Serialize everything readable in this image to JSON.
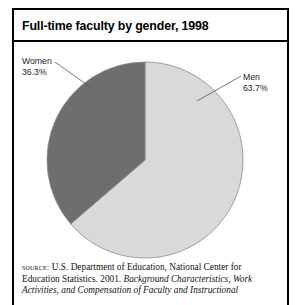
{
  "figure": {
    "title": "Full-time faculty by gender, 1998",
    "frame_color": "#000000",
    "background": "#ffffff"
  },
  "labels": {
    "women_name": "Women",
    "women_value": "36.3%",
    "men_name": "Men",
    "men_value": "63.7%"
  },
  "source": {
    "prefix": "source:",
    "line1_rest": " U.S. Department of Education, National Center for",
    "line2_roman": "Education Statistics. 2001. ",
    "line2_italic": "Background Characteristics, Work",
    "line3_italic": "Activities, and Compensation of Faculty and Instructional"
  },
  "chart_data": {
    "type": "pie",
    "title": "Full-time faculty by gender, 1998",
    "categories": [
      "Men",
      "Women"
    ],
    "values": [
      63.7,
      36.3
    ],
    "units": "percent",
    "labels": [
      "Men 63.7%",
      "Women 36.3%"
    ],
    "colors": [
      "#d9d9d9",
      "#6e6e6e"
    ],
    "slice_colors": {
      "men": "#d9d9d9",
      "women": "#6e6e6e"
    },
    "start_angle_deg": 90,
    "direction": "counterclockwise",
    "legend": "callout-labels",
    "grid": false,
    "center_px": [
      145,
      160
    ],
    "radius_px": 98,
    "outline_color": "#8a8a8a"
  }
}
